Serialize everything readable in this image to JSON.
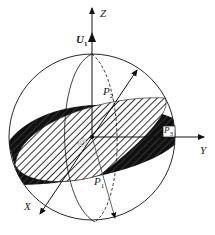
{
  "diagram": {
    "type": "sphere-with-tilted-plane",
    "labels": {
      "z_axis": "Z",
      "y_axis": "Y",
      "x_axis": "X",
      "origin": "O",
      "vector_u": "U",
      "vector_u_sub": "1",
      "point_p1": "P",
      "point_p1_sub": "1",
      "point_p2": "P",
      "point_p2_sub": "2",
      "point_p3": "P",
      "point_p3_sub": "3"
    },
    "colors": {
      "stroke": "#111111",
      "dark_band": "#1a1a1a",
      "hatch": "#333333",
      "background": "#ffffff"
    }
  }
}
